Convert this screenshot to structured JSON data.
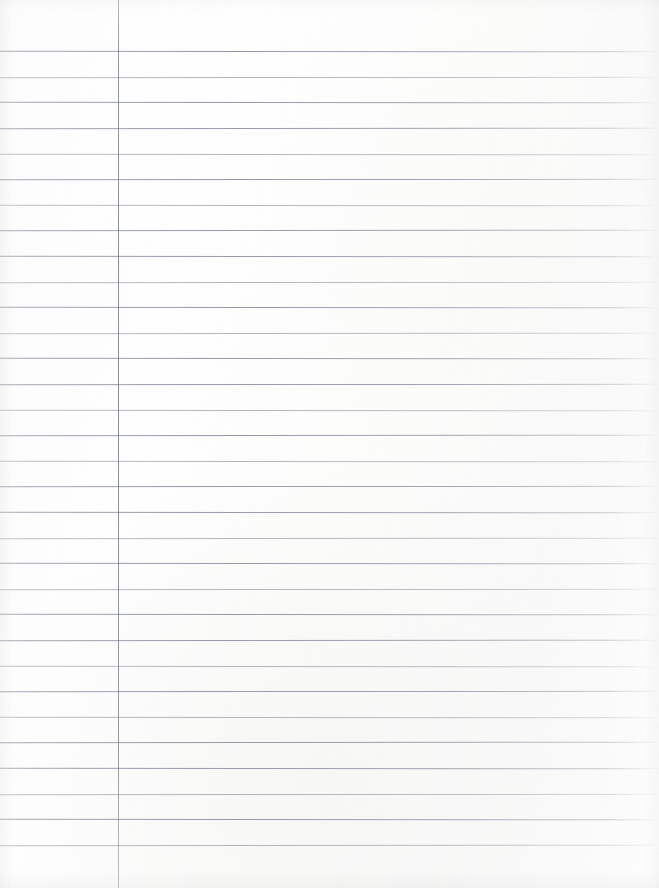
{
  "document": {
    "type": "ruled-notebook-paper",
    "title": "Blank lined notebook page",
    "orientation": "portrait",
    "page_width_px": 659,
    "page_height_px": 888,
    "content_text": "",
    "has_handwriting": false,
    "has_printed_text": false
  },
  "paper": {
    "background_color": "#fdfdfd",
    "texture": "scanned paper grain",
    "edge_shading": true
  },
  "ruling": {
    "style": "wide ruled",
    "line_color": "#7d8594",
    "line_thickness_px": 1,
    "line_count": 32,
    "first_line_y_px": 51,
    "line_spacing_px": 25.6,
    "last_line_y_px": 845,
    "line_start_x_px": 0,
    "line_end_x_px": 659,
    "right_edge_fade": true,
    "line_y_positions": [
      51,
      77,
      102,
      128,
      154,
      179,
      205,
      230,
      256,
      282,
      307,
      333,
      358,
      384,
      410,
      435,
      461,
      486,
      512,
      538,
      563,
      589,
      614,
      640,
      666,
      691,
      717,
      742,
      768,
      794,
      819,
      845
    ]
  },
  "margin_rule": {
    "orientation": "vertical",
    "color": "#707884",
    "thickness_px": 1,
    "x_px": 118,
    "top_y_px": 0,
    "bottom_y_px": 888,
    "full_height": true,
    "label": "left margin line"
  }
}
